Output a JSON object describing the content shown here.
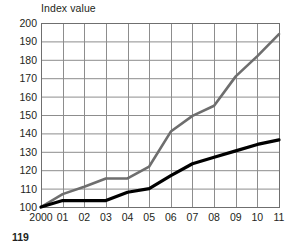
{
  "figure": {
    "title": "Index value",
    "page_number": "119"
  },
  "chart_data": {
    "type": "line",
    "title": "Index value",
    "xlabel": "",
    "ylabel": "Index value",
    "x": [
      "2000",
      "01",
      "02",
      "03",
      "04",
      "05",
      "06",
      "07",
      "08",
      "09",
      "10",
      "11"
    ],
    "categories": [
      "2000",
      "01",
      "02",
      "03",
      "04",
      "05",
      "06",
      "07",
      "08",
      "09",
      "10",
      "11"
    ],
    "xtick_labels": [
      "2000",
      "01",
      "02",
      "03",
      "04",
      "05",
      "06",
      "07",
      "08",
      "09",
      "10",
      "11"
    ],
    "ytick_labels": [
      "100",
      "110",
      "120",
      "130",
      "140",
      "150",
      "160",
      "170",
      "180",
      "190",
      "200"
    ],
    "yticks": [
      100,
      110,
      120,
      130,
      140,
      150,
      160,
      170,
      180,
      190,
      200
    ],
    "ylim": [
      100,
      200
    ],
    "grid": true,
    "legend": "none",
    "series": [
      {
        "name": "gray-series",
        "color": "#6e6e6e",
        "width": 2.6,
        "values": [
          100,
          107,
          111,
          115.5,
          115.5,
          122,
          141,
          149.5,
          155,
          171,
          182,
          194
        ]
      },
      {
        "name": "black-series",
        "color": "#000000",
        "width": 3.2,
        "values": [
          100,
          103.5,
          103.5,
          103.5,
          108,
          110,
          117,
          123.5,
          127,
          130.5,
          134,
          136.5
        ]
      }
    ]
  },
  "style": {
    "grid_color": "#8d8d8d",
    "axis_color": "#6f6f6f",
    "text_color": "#231f20",
    "background": "#ffffff"
  },
  "geometry": {
    "plot_left": 41,
    "plot_right": 279,
    "plot_top": 23,
    "plot_bottom": 207
  }
}
